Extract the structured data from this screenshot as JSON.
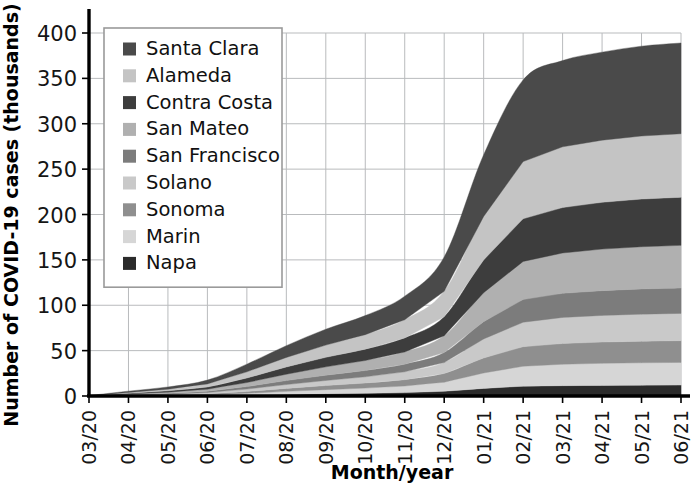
{
  "chart_data": {
    "type": "area",
    "stacked": true,
    "title": "",
    "xlabel": "Month/year",
    "ylabel": "Number of COVID-19 cases (thousands)",
    "ylim": [
      0,
      400
    ],
    "yticks": [
      0,
      50,
      100,
      150,
      200,
      250,
      300,
      350,
      400
    ],
    "ytick_labels": [
      "0",
      "50",
      "100",
      "150",
      "200",
      "250",
      "300",
      "350",
      "400"
    ],
    "grid": true,
    "grid_color": "#b9bbbd",
    "legend_position": "top-left",
    "categories": [
      "03/20",
      "04/20",
      "05/20",
      "06/20",
      "07/20",
      "08/20",
      "09/20",
      "10/20",
      "11/20",
      "12/20",
      "01/21",
      "02/21",
      "03/21",
      "04/21",
      "05/21",
      "06/21"
    ],
    "x": [
      "03/20",
      "04/20",
      "05/20",
      "06/20",
      "07/20",
      "08/20",
      "09/20",
      "10/20",
      "11/20",
      "12/20",
      "01/21",
      "02/21",
      "03/21",
      "04/21",
      "05/21",
      "06/21"
    ],
    "stack_order_bottom_to_top": [
      "Napa",
      "Marin",
      "Sonoma",
      "Solano",
      "San Francisco",
      "San Mateo",
      "Contra Costa",
      "Alameda",
      "Santa Clara"
    ],
    "series": [
      {
        "name": "Santa Clara",
        "color": "#4a4a4a",
        "values": [
          0.1,
          1.4,
          2.4,
          4.2,
          8.5,
          13.0,
          17.5,
          21.0,
          26.0,
          38.0,
          68.0,
          90.0,
          95.0,
          97.0,
          99.0,
          100.0
        ]
      },
      {
        "name": "Alameda",
        "color": "#c4c4c4",
        "values": [
          0.1,
          1.0,
          1.9,
          3.4,
          6.8,
          10.5,
          13.5,
          16.0,
          20.0,
          28.0,
          48.0,
          63.0,
          67.0,
          68.5,
          69.5,
          70.0
        ]
      },
      {
        "name": "Contra Costa",
        "color": "#3d3d3d",
        "values": [
          0.05,
          0.8,
          1.4,
          2.4,
          5.0,
          8.0,
          10.5,
          12.5,
          15.5,
          21.0,
          36.0,
          47.0,
          50.0,
          51.5,
          52.5,
          53.0
        ]
      },
      {
        "name": "San Mateo",
        "color": "#b0b0b0",
        "values": [
          0.05,
          0.7,
          1.3,
          2.2,
          4.4,
          7.0,
          9.2,
          11.0,
          13.5,
          18.5,
          32.0,
          42.0,
          44.5,
          45.8,
          46.5,
          47.0
        ]
      },
      {
        "name": "San Francisco",
        "color": "#7c7c7c",
        "values": [
          0.05,
          0.5,
          0.9,
          1.5,
          2.8,
          4.4,
          5.8,
          7.0,
          8.4,
          11.0,
          19.0,
          25.0,
          26.5,
          27.3,
          27.8,
          28.0
        ]
      },
      {
        "name": "Solano",
        "color": "#c9c9c9",
        "values": [
          0.02,
          0.3,
          0.7,
          1.3,
          2.6,
          4.2,
          5.6,
          6.8,
          8.6,
          12.0,
          21.0,
          27.0,
          28.8,
          29.4,
          29.8,
          30.0
        ]
      },
      {
        "name": "Sonoma",
        "color": "#8f8f8f",
        "values": [
          0.02,
          0.25,
          0.5,
          1.0,
          2.0,
          3.3,
          4.5,
          5.6,
          7.0,
          9.6,
          16.5,
          21.5,
          22.8,
          23.4,
          23.8,
          24.0
        ]
      },
      {
        "name": "Marin",
        "color": "#d6d6d6",
        "values": [
          0.02,
          0.3,
          0.6,
          1.0,
          2.0,
          3.4,
          4.6,
          5.7,
          7.2,
          10.0,
          17.0,
          22.0,
          23.6,
          24.3,
          24.7,
          25.0
        ]
      },
      {
        "name": "Napa",
        "color": "#2b2b2b",
        "values": [
          0.01,
          0.1,
          0.25,
          0.5,
          1.0,
          1.7,
          2.4,
          3.0,
          3.8,
          5.2,
          8.4,
          10.8,
          11.4,
          11.7,
          11.9,
          12.0
        ]
      }
    ],
    "totals": [
      0.42,
      5.35,
      9.95,
      17.5,
      35.1,
      55.5,
      73.6,
      88.6,
      110.0,
      153.3,
      265.9,
      348.3,
      369.6,
      378.9,
      385.5,
      389.0
    ]
  },
  "legend": {
    "entries": [
      {
        "label": "Santa Clara",
        "color": "#4a4a4a"
      },
      {
        "label": "Alameda",
        "color": "#c4c4c4"
      },
      {
        "label": "Contra Costa",
        "color": "#3d3d3d"
      },
      {
        "label": "San Mateo",
        "color": "#b0b0b0"
      },
      {
        "label": "San Francisco",
        "color": "#7c7c7c"
      },
      {
        "label": "Solano",
        "color": "#c9c9c9"
      },
      {
        "label": "Sonoma",
        "color": "#8f8f8f"
      },
      {
        "label": "Marin",
        "color": "#d6d6d6"
      },
      {
        "label": "Napa",
        "color": "#2b2b2b"
      }
    ]
  },
  "axes": {
    "y_title": "Number of COVID-19 cases (thousands)",
    "x_title": "Month/year",
    "y_ticks": [
      "400",
      "350",
      "300",
      "250",
      "200",
      "150",
      "100",
      "50",
      "0"
    ],
    "x_ticks": [
      "03/20",
      "04/20",
      "05/20",
      "06/20",
      "07/20",
      "08/20",
      "09/20",
      "10/20",
      "11/20",
      "12/20",
      "01/21",
      "02/21",
      "03/21",
      "04/21",
      "05/21",
      "06/21"
    ]
  }
}
